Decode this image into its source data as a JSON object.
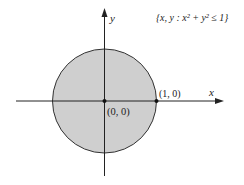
{
  "diagram": {
    "set_label": "{x, y : x² + y² ≤ 1}",
    "x_axis_label": "x",
    "y_axis_label": "y",
    "points": [
      {
        "label": "(0, 0)",
        "x": 0,
        "y": 0
      },
      {
        "label": "(1, 0)",
        "x": 1,
        "y": 0
      }
    ],
    "region": {
      "shape": "disk",
      "center": [
        0,
        0
      ],
      "radius": 1,
      "fill": "#cfcfcf",
      "stroke": "#333333"
    },
    "axis_color": "#222222"
  }
}
